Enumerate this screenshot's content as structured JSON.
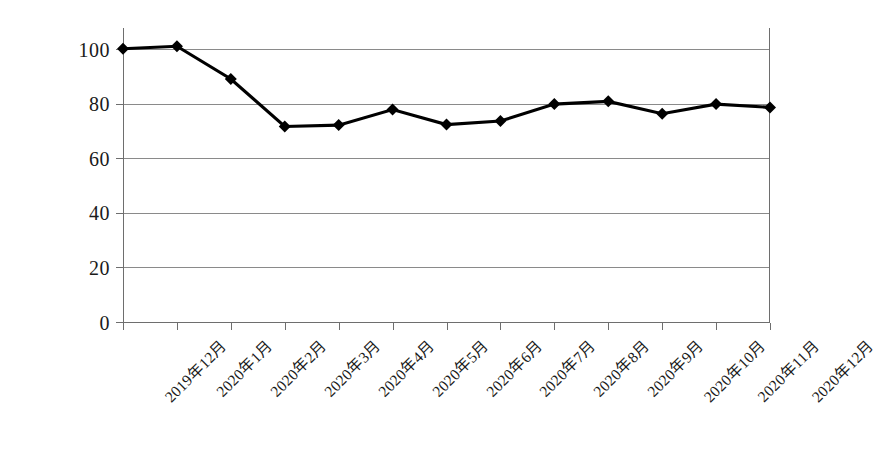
{
  "chart_data": {
    "type": "line",
    "title": "",
    "subtitle": "",
    "xlabel": "",
    "ylabel": "",
    "ylim": [
      0,
      100
    ],
    "yticks": [
      0,
      20,
      40,
      60,
      80,
      100
    ],
    "grid": true,
    "legend": false,
    "legend_position": "none",
    "marker": "diamond",
    "line_color": "#000000",
    "marker_color": "#000000",
    "grid_color": "#8a8a8a",
    "axis_color": "#6e6e6e",
    "categories": [
      "2019年12月",
      "2020年1月",
      "2020年2月",
      "2020年3月",
      "2020年4月",
      "2020年5月",
      "2020年6月",
      "2020年7月",
      "2020年8月",
      "2020年9月",
      "2020年10月",
      "2020年11月",
      "2020年12月"
    ],
    "values": [
      100.3,
      101.2,
      89.2,
      71.8,
      72.3,
      78.0,
      72.5,
      73.8,
      80.0,
      81.0,
      76.5,
      80.0,
      78.8
    ],
    "series": [
      {
        "name": "指数",
        "values": [
          100.3,
          101.2,
          89.2,
          71.8,
          72.3,
          78.0,
          72.5,
          73.8,
          80.0,
          81.0,
          76.5,
          80.0,
          78.8
        ]
      }
    ]
  },
  "axis": {
    "y_tick_labels": [
      "100",
      "80",
      "60",
      "40",
      "20",
      "0"
    ]
  }
}
